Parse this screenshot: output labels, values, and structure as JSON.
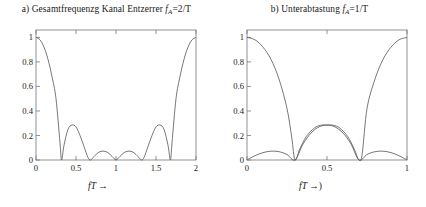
{
  "figure": {
    "width": 426,
    "height": 207,
    "background": "#ffffff",
    "line_color": "#555555",
    "axis_color": "#777777"
  },
  "panels": [
    {
      "id": "panel-a",
      "title_prefix": "a) Gesamtfrequenzg Kanal Entzerrer ",
      "title_symbol": "f",
      "title_sub": "A",
      "title_suffix": "=2/T",
      "xlabel": "fT",
      "xlabel_arrow": "→",
      "xticks": [
        "0",
        "0.5",
        "1",
        "1.5",
        "2"
      ],
      "xtick_values": [
        0,
        0.5,
        1,
        1.5,
        2
      ],
      "yticks": [
        "0",
        "0.2",
        "0.4",
        "0.6",
        "0.8",
        "1"
      ],
      "ytick_values": [
        0,
        0.2,
        0.4,
        0.6,
        0.8,
        1
      ]
    },
    {
      "id": "panel-b",
      "title_prefix": "b) Unterabtastung ",
      "title_symbol": "f",
      "title_sub": "A",
      "title_suffix": "=1/T",
      "xlabel": "fT",
      "xlabel_arrow": "→)",
      "xticks": [
        "0",
        "0.5",
        "1"
      ],
      "xtick_values": [
        0,
        0.5,
        1
      ],
      "yticks": [
        "0",
        "0.2",
        "0.4",
        "0.6",
        "0.8",
        "1"
      ],
      "ytick_values": [
        0,
        0.2,
        0.4,
        0.6,
        0.8,
        1
      ]
    }
  ],
  "chart_data": [
    {
      "type": "line",
      "title": "a) Gesamtfrequenzg Kanal Entzerrer f_A=2/T",
      "xlabel": "fT →",
      "ylabel": "",
      "xlim": [
        0,
        2
      ],
      "ylim": [
        0,
        1.06
      ],
      "grid": false,
      "legend": "none",
      "series": [
        {
          "name": "Gesamtfrequenzgang",
          "comment": "abs of a sinc-like lobed response, period 2, symmetric about fT=1",
          "x": [
            0,
            0.05,
            0.1,
            0.15,
            0.2,
            0.25,
            0.3,
            0.32,
            0.35,
            0.4,
            0.45,
            0.5,
            0.55,
            0.6,
            0.65,
            0.68,
            0.7,
            0.75,
            0.8,
            0.85,
            0.9,
            0.95,
            1.0,
            1.05,
            1.1,
            1.15,
            1.2,
            1.25,
            1.3,
            1.32,
            1.35,
            1.4,
            1.45,
            1.5,
            1.55,
            1.6,
            1.65,
            1.68,
            1.7,
            1.75,
            1.8,
            1.85,
            1.9,
            1.95,
            2.0
          ],
          "y": [
            1.0,
            0.98,
            0.92,
            0.82,
            0.68,
            0.5,
            0.14,
            0.0,
            0.12,
            0.25,
            0.285,
            0.27,
            0.2,
            0.11,
            0.02,
            0.0,
            0.01,
            0.045,
            0.068,
            0.072,
            0.06,
            0.03,
            0.0,
            0.03,
            0.06,
            0.072,
            0.068,
            0.045,
            0.01,
            0.0,
            0.02,
            0.11,
            0.2,
            0.27,
            0.285,
            0.25,
            0.12,
            0.0,
            0.14,
            0.5,
            0.68,
            0.82,
            0.92,
            0.98,
            1.0
          ]
        }
      ]
    },
    {
      "type": "line",
      "title": "b) Unterabtastung f_A=1/T",
      "xlabel": "fT →)",
      "ylabel": "",
      "xlim": [
        0,
        1
      ],
      "ylim": [
        0,
        1.06
      ],
      "grid": false,
      "legend": "none",
      "series": [
        {
          "name": "Gesamtfrequenzgang (aliased)",
          "comment": "main lobes at 0 and 1, zero near 0.3 and 0.7, central hump peak ~0.285 at 0.5",
          "x": [
            0,
            0.05,
            0.1,
            0.15,
            0.2,
            0.25,
            0.28,
            0.3,
            0.33,
            0.37,
            0.42,
            0.46,
            0.5,
            0.54,
            0.58,
            0.63,
            0.67,
            0.7,
            0.72,
            0.75,
            0.8,
            0.85,
            0.9,
            0.95,
            1.0
          ],
          "y": [
            1.0,
            0.98,
            0.92,
            0.82,
            0.66,
            0.42,
            0.18,
            0.0,
            0.09,
            0.19,
            0.26,
            0.283,
            0.285,
            0.283,
            0.26,
            0.19,
            0.09,
            0.0,
            0.05,
            0.42,
            0.66,
            0.82,
            0.92,
            0.98,
            1.0
          ]
        },
        {
          "name": "Teilspektrum (small lobes)",
          "comment": "low ripple lobes peaking ~0.072 with zeros at 0 and 0.3, 0.3 and 0.7, 0.7 and 1",
          "x": [
            0,
            0.05,
            0.1,
            0.15,
            0.2,
            0.25,
            0.3,
            0.35,
            0.4,
            0.45,
            0.5,
            0.55,
            0.6,
            0.65,
            0.7,
            0.75,
            0.8,
            0.85,
            0.9,
            0.95,
            1.0
          ],
          "y": [
            0.0,
            0.035,
            0.06,
            0.072,
            0.068,
            0.045,
            0.0,
            0.13,
            0.22,
            0.27,
            0.285,
            0.27,
            0.22,
            0.13,
            0.0,
            0.045,
            0.068,
            0.072,
            0.06,
            0.035,
            0.0
          ]
        }
      ]
    }
  ]
}
